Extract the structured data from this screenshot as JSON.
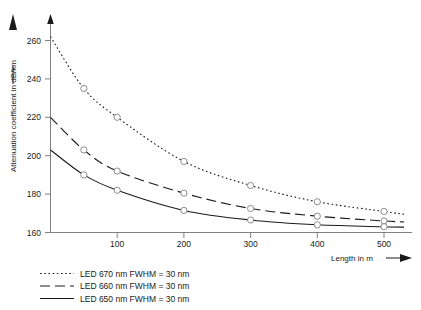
{
  "chart_data": {
    "type": "line",
    "title": "",
    "xlabel": "Length in m",
    "ylabel": "Attenuation coefficient in dB/km",
    "xlim": [
      0,
      540
    ],
    "ylim": [
      160,
      268
    ],
    "xticks": [
      100,
      200,
      300,
      400,
      500
    ],
    "yticks": [
      160,
      180,
      200,
      220,
      240,
      260
    ],
    "xtick_labels": [
      "100",
      "200",
      "300",
      "400",
      "500"
    ],
    "ytick_labels": [
      "160",
      "180",
      "200",
      "220",
      "240",
      "260"
    ],
    "grid": false,
    "legend_position": "below-left",
    "x": [
      0,
      50,
      100,
      200,
      300,
      400,
      500,
      530
    ],
    "series": [
      {
        "name": "LED 670 nm FWHM = 30 nm",
        "style": "dotted",
        "marker": "circle-open",
        "values": [
          262,
          235,
          220,
          197,
          184.5,
          176,
          171,
          169.5
        ]
      },
      {
        "name": "LED 660 nm FWHM = 30 nm",
        "style": "dashed",
        "marker": "circle-open",
        "values": [
          220,
          203,
          192,
          180.5,
          172.5,
          168.5,
          166,
          165.5
        ]
      },
      {
        "name": "LED 650 nm FWHM = 30 nm",
        "style": "solid",
        "marker": "circle-open",
        "values": [
          203,
          190,
          182,
          171.5,
          166.5,
          164,
          163,
          162.8
        ]
      }
    ],
    "marker_x": [
      50,
      100,
      200,
      300,
      400,
      500
    ],
    "colors": {
      "line": "#1a1a1a",
      "axis": "#808080",
      "marker_stroke": "#808080",
      "background": "#ffffff"
    },
    "axis_arrows": {
      "x_arrow": "right-arrow",
      "y_arrow": "up-arrow"
    }
  },
  "legend": {
    "items": [
      {
        "label": "LED 670 nm FWHM = 30 nm",
        "style": "dotted"
      },
      {
        "label": "LED 660 nm FWHM = 30 nm",
        "style": "dashed"
      },
      {
        "label": "LED 650 nm FWHM = 30 nm",
        "style": "solid"
      }
    ]
  }
}
